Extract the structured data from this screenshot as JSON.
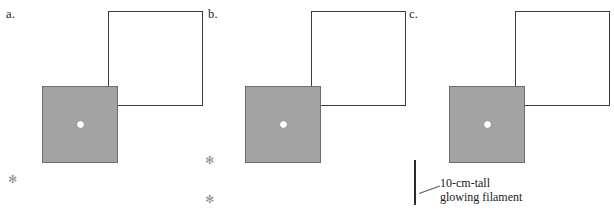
{
  "figure": {
    "panels": [
      {
        "label": "a.",
        "label_x": 6,
        "label_y": 8,
        "camera": {
          "x": 42,
          "y": 86,
          "w": 76,
          "h": 77,
          "fill": "#a3a3a3",
          "stroke": "#6d6d6d"
        },
        "pinhole": {
          "cx": 80,
          "cy": 124,
          "d": 9
        },
        "screen": {
          "x": 108,
          "y": 11,
          "w": 95,
          "h": 95,
          "stroke": "#3b3b3b"
        },
        "sources": [
          {
            "x": 7,
            "y": 174,
            "glyph": "✻",
            "name": "point-light-source"
          }
        ],
        "filament": null,
        "legend": null
      },
      {
        "label": "b.",
        "label_x": 208,
        "label_y": 8,
        "camera": {
          "x": 245,
          "y": 86,
          "w": 76,
          "h": 77,
          "fill": "#a3a3a3",
          "stroke": "#6d6d6d"
        },
        "pinhole": {
          "cx": 283,
          "cy": 124,
          "d": 9
        },
        "screen": {
          "x": 311,
          "y": 11,
          "w": 95,
          "h": 95,
          "stroke": "#3b3b3b"
        },
        "sources": [
          {
            "x": 204,
            "y": 155,
            "glyph": "✻",
            "name": "point-light-source"
          },
          {
            "x": 204,
            "y": 194,
            "glyph": "✻",
            "name": "point-light-source"
          }
        ],
        "filament": null,
        "legend": null
      },
      {
        "label": "c.",
        "label_x": 409,
        "label_y": 8,
        "camera": {
          "x": 449,
          "y": 86,
          "w": 76,
          "h": 77,
          "fill": "#a3a3a3",
          "stroke": "#6d6d6d"
        },
        "pinhole": {
          "cx": 487,
          "cy": 124,
          "d": 9
        },
        "screen": {
          "x": 515,
          "y": 11,
          "w": 95,
          "h": 95,
          "stroke": "#3b3b3b"
        },
        "sources": [],
        "filament": {
          "x": 414,
          "y": 160,
          "w": 2,
          "h": 45,
          "color": "#2b2b2b"
        },
        "legend": {
          "line1": "10-cm-tall",
          "line2": "glowing filament",
          "text_x": 440,
          "text_y": 179,
          "leader_x": 419,
          "leader_y": 193,
          "leader_len": 20,
          "leader_angle": -18
        }
      }
    ]
  }
}
